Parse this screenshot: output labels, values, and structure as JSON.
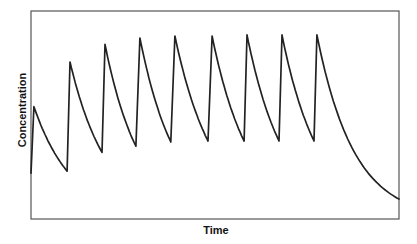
{
  "chart_data": {
    "type": "line",
    "title": "",
    "xlabel": "Time",
    "ylabel": "Concentration",
    "xlim": [
      0,
      100
    ],
    "ylim": [
      0,
      100
    ],
    "grid": false,
    "legend": null,
    "ticks": {
      "x": [],
      "y": []
    },
    "series": [
      {
        "name": "Concentration",
        "color": "#222222",
        "points": [
          [
            0,
            22
          ],
          [
            0.8,
            54
          ],
          [
            4,
            45
          ],
          [
            7,
            37.5
          ],
          [
            10,
            31.5
          ],
          [
            13,
            26.5
          ],
          [
            9.8,
            23
          ],
          [
            9.8,
            23
          ],
          [
            10.6,
            75.5
          ],
          [
            14,
            64
          ],
          [
            17,
            53
          ],
          [
            20,
            44
          ],
          [
            19.3,
            32
          ],
          [
            19.3,
            32
          ],
          [
            20.1,
            84
          ],
          [
            23,
            72
          ],
          [
            26,
            60
          ],
          [
            29,
            49
          ],
          [
            28.5,
            35
          ],
          [
            28.5,
            35
          ],
          [
            29.6,
            87
          ],
          [
            32,
            75
          ],
          [
            35,
            62
          ],
          [
            38,
            51
          ],
          [
            37.2,
            37
          ],
          [
            37.2,
            37
          ],
          [
            39.7,
            88
          ],
          [
            41.5,
            76
          ],
          [
            44,
            63
          ],
          [
            47,
            52
          ],
          [
            48.1,
            37.5
          ],
          [
            48.1,
            37.5
          ],
          [
            49.2,
            88
          ],
          [
            51,
            76
          ],
          [
            54,
            63
          ],
          [
            57,
            52
          ],
          [
            57.9,
            37.5
          ],
          [
            57.9,
            37.5
          ],
          [
            58.7,
            88.5
          ],
          [
            60.5,
            76
          ],
          [
            63.5,
            63
          ],
          [
            66.5,
            52
          ],
          [
            67.4,
            37.5
          ],
          [
            67.4,
            37.5
          ],
          [
            68.2,
            88.5
          ],
          [
            70,
            76
          ],
          [
            73,
            63
          ],
          [
            76,
            52
          ],
          [
            76.9,
            37.5
          ],
          [
            76.9,
            37.5
          ],
          [
            77.7,
            88.5
          ],
          [
            80,
            75
          ],
          [
            84,
            57
          ],
          [
            88,
            41
          ],
          [
            92,
            28
          ],
          [
            96,
            18
          ],
          [
            100,
            9.6
          ]
        ],
        "segments": [
          {
            "start": [
              0,
              22
            ],
            "peak": [
              0.8,
              54
            ],
            "trough": [
              9.8,
              23
            ]
          },
          {
            "peak": [
              10.6,
              75.5
            ],
            "trough": [
              19.3,
              32
            ]
          },
          {
            "peak": [
              20.1,
              84
            ],
            "trough": [
              28.5,
              35
            ]
          },
          {
            "peak": [
              29.6,
              87
            ],
            "trough": [
              38.0,
              37
            ]
          },
          {
            "peak": [
              39.1,
              88
            ],
            "trough": [
              48.1,
              37.5
            ]
          },
          {
            "peak": [
              49.2,
              88
            ],
            "trough": [
              57.9,
              37.5
            ]
          },
          {
            "peak": [
              58.7,
              88.5
            ],
            "trough": [
              67.4,
              37.5
            ]
          },
          {
            "peak": [
              68.2,
              88.5
            ],
            "trough": [
              76.9,
              37.5
            ]
          },
          {
            "peak": [
              77.7,
              88.5
            ],
            "end": [
              100,
              9.6
            ]
          }
        ]
      }
    ]
  },
  "layout": {
    "plot": {
      "left": 31,
      "top": 11,
      "right": 399,
      "bottom": 219
    },
    "frame_color": "#555555",
    "line_color": "#222222"
  }
}
